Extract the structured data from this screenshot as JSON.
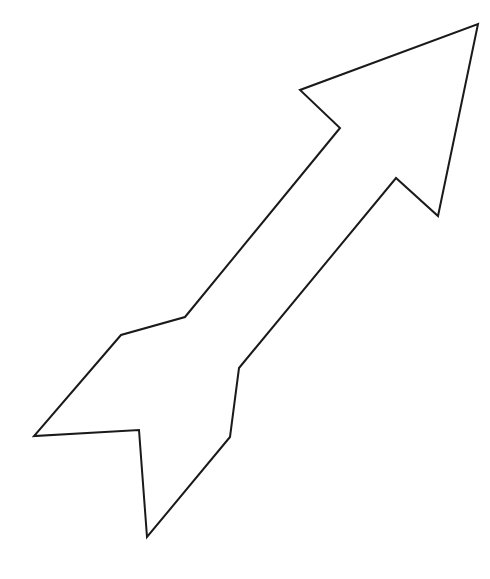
{
  "figure": {
    "width": 490,
    "height": 579,
    "background": "#ffffff",
    "shape": {
      "type": "arrow-outline",
      "stroke": "#1a1a1a",
      "stroke_width": 2,
      "fill": "#ffffff",
      "points": "478,24 438,216 396,178 239,368 230,437 147,537 139,430 34,436 121,335 185,317 340,128 300,90"
    }
  }
}
